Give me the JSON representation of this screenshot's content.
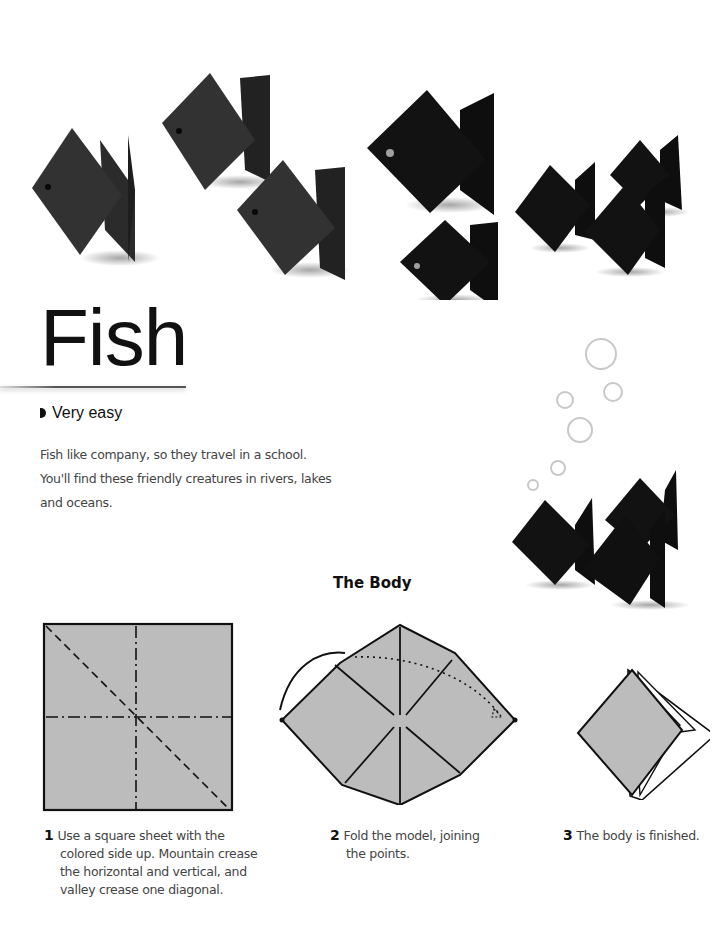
{
  "page": {
    "title": "Fish",
    "difficulty": "Very easy",
    "intro": "Fish like company, so they travel in a school. You'll find these friendly creatures in rivers, lakes and oceans.",
    "intro_lines": [
      "Fish like company, so they travel in a school.",
      "You'll find these friendly creatures in rivers, lakes",
      "and oceans."
    ],
    "section_title": "The Body"
  },
  "photo": {
    "description": "Black folded paper origami fish models standing in a row",
    "fish_count": 9,
    "bubbles_count": 6,
    "fish_color": "#1a1a1a"
  },
  "steps": [
    {
      "number": "1",
      "text": "Use a square sheet with the colored side up. Mountain crease the horizontal and vertical, and valley crease one diagonal.",
      "diagram": "square-sheet-creases"
    },
    {
      "number": "2",
      "text": "Fold the model, joining the points.",
      "diagram": "fold-joining-points"
    },
    {
      "number": "3",
      "text": "The body is finished.",
      "diagram": "finished-body"
    }
  ],
  "colors": {
    "paper_gray": "#bcbcbc",
    "ink": "#111111",
    "text": "#444444"
  }
}
